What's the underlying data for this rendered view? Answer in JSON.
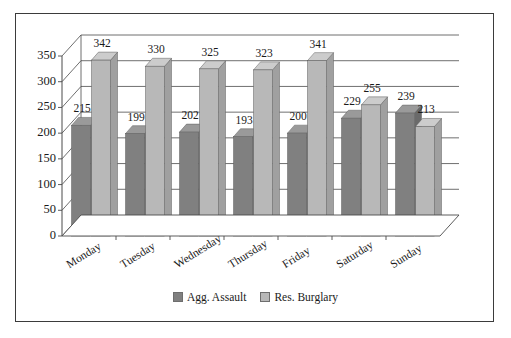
{
  "chart_data": {
    "type": "bar",
    "title": "",
    "subtitle": "",
    "xlabel": "",
    "ylabel": "",
    "categories": [
      "Monday",
      "Tuesday",
      "Wednesday",
      "Thursday",
      "Friday",
      "Saturday",
      "Sunday"
    ],
    "series": [
      {
        "name": "Agg. Assault",
        "color": "#808080",
        "values": [
          215,
          199,
          202,
          193,
          200,
          229,
          239
        ]
      },
      {
        "name": "Res. Burglary",
        "color": "#b8b8b8",
        "values": [
          342,
          330,
          325,
          323,
          341,
          255,
          213
        ]
      }
    ],
    "yticks": [
      0,
      50,
      100,
      150,
      200,
      250,
      300,
      350
    ],
    "ylim": [
      0,
      350
    ],
    "grid": true,
    "legend_position": "bottom",
    "style": "3d-grouped-column",
    "data_labels": true
  },
  "legend": {
    "items": [
      {
        "label": "Agg. Assault",
        "color": "#808080"
      },
      {
        "label": "Res. Burglary",
        "color": "#b8b8b8"
      }
    ]
  },
  "colors": {
    "assault_front": "#808080",
    "assault_top": "#9a9a9a",
    "assault_side": "#6a6a6a",
    "burglary_front": "#b8b8b8",
    "burglary_top": "#cccccc",
    "burglary_side": "#a0a0a0",
    "axis": "#4a4a4a",
    "frame": "#3b3b3b",
    "text": "#1a1a1a"
  }
}
